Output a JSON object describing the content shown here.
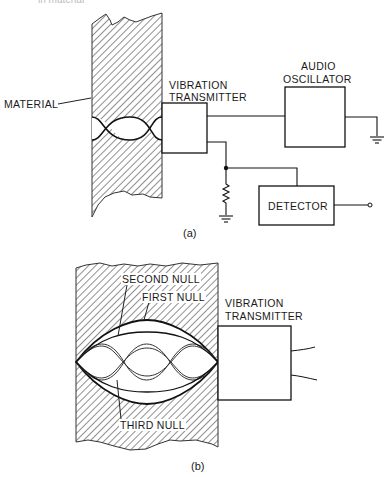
{
  "header": {
    "cut_text": "in material"
  },
  "figure_a": {
    "caption": "(a)",
    "material_label": "MATERIAL",
    "transmitter_label_1": "VIBRATION",
    "transmitter_label_2": "TRANSMITTER",
    "oscillator_label_1": "AUDIO",
    "oscillator_label_2": "OSCILLATOR",
    "detector_label": "DETECTOR"
  },
  "figure_b": {
    "caption": "(b)",
    "transmitter_label_1": "VIBRATION",
    "transmitter_label_2": "TRANSMITTER",
    "null_labels": [
      "SECOND NULL",
      "FIRST NULL",
      "THIRD NULL"
    ]
  },
  "colors": {
    "ink": "#1a1a1a",
    "background": "#ffffff"
  }
}
